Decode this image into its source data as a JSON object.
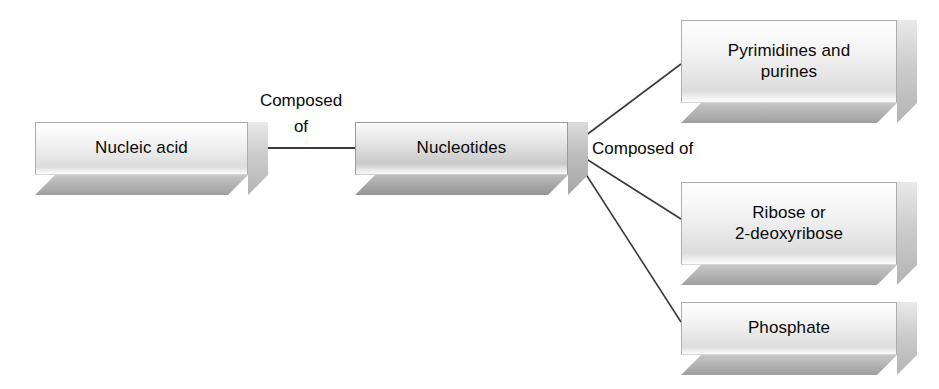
{
  "diagram": {
    "type": "hierarchy-flow",
    "background_color": "#ffffff",
    "text_color": "#0a0a0a",
    "line_color": "#3a3a3a",
    "nodes": [
      {
        "id": "nucleic-acid",
        "label": "Nucleic acid",
        "shade": "light"
      },
      {
        "id": "nucleotides",
        "label": "Nucleotides",
        "shade": "dark"
      },
      {
        "id": "pyrimidines-and-purines",
        "label": "Pyrimidines and\npurines",
        "shade": "light"
      },
      {
        "id": "ribose-or-2-deoxyribose",
        "label": "Ribose or\n2-deoxyribose",
        "shade": "light"
      },
      {
        "id": "phosphate",
        "label": "Phosphate",
        "shade": "light"
      }
    ],
    "edge_labels": [
      {
        "id": "composed-of-primary",
        "text": "Composed\nof"
      },
      {
        "id": "composed-of-secondary",
        "text": "Composed of"
      }
    ]
  }
}
